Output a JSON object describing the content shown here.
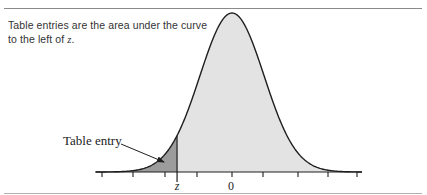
{
  "caption": {
    "text_before": "Table entries are the area under the curve to the left of ",
    "variable": "z",
    "text_after": "."
  },
  "figure": {
    "annotation_label": "Table entry",
    "z_label": "z",
    "zero_label": "0",
    "colors": {
      "shaded_left": "#9c9c9c",
      "shaded_right": "#e3e3e3",
      "curve": "#1e1e1e",
      "axis": "#1e1e1e",
      "rule": "#8a8a8a"
    }
  },
  "chart_data": {
    "type": "area",
    "description": "Table entries are the area under the curve to the left of z.",
    "distribution": "standard normal",
    "mean": 0,
    "sd": 1,
    "x_tick_count": 9,
    "x_labels": [
      {
        "position": "z",
        "label": "z"
      },
      {
        "position": 0,
        "label": "0"
      }
    ],
    "z_position_sd": -1.7,
    "shaded_region": "left of z (table entry)",
    "annotations": [
      "Table entry"
    ],
    "grid": false
  }
}
